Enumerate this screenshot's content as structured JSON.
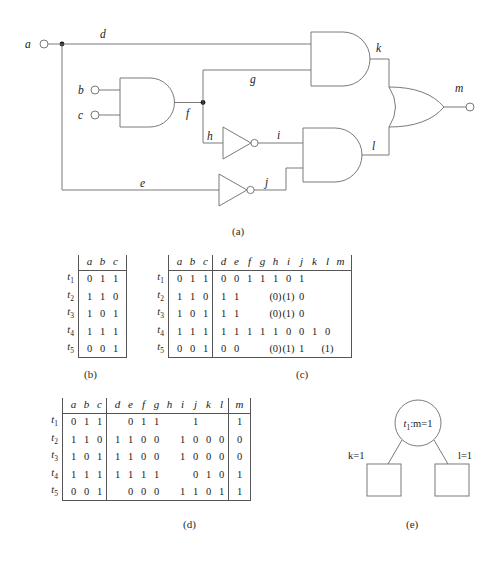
{
  "figure": {
    "captions": {
      "a": "(a)",
      "b": "(b)",
      "c": "(c)",
      "d": "(d)",
      "e": "(e)"
    }
  },
  "circuit": {
    "inputs": [
      {
        "name": "a",
        "label": "a"
      },
      {
        "name": "b",
        "label": "b"
      },
      {
        "name": "c",
        "label": "c"
      }
    ],
    "wires": [
      {
        "name": "d",
        "label": "d"
      },
      {
        "name": "e",
        "label": "e"
      },
      {
        "name": "f",
        "label": "f"
      },
      {
        "name": "g",
        "label": "g"
      },
      {
        "name": "h",
        "label": "h"
      },
      {
        "name": "i",
        "label": "i"
      },
      {
        "name": "j",
        "label": "j"
      },
      {
        "name": "k",
        "label": "k"
      },
      {
        "name": "l",
        "label": "l"
      }
    ],
    "output": {
      "name": "m",
      "label": "m"
    },
    "gates": [
      {
        "name": "and-bc",
        "type": "and",
        "inputs": [
          "b",
          "c"
        ],
        "output": "f"
      },
      {
        "name": "not-h",
        "type": "not",
        "inputs": [
          "h"
        ],
        "output": "i"
      },
      {
        "name": "not-e",
        "type": "not",
        "inputs": [
          "e"
        ],
        "output": "j"
      },
      {
        "name": "and-dg",
        "type": "and",
        "inputs": [
          "d",
          "g"
        ],
        "output": "k"
      },
      {
        "name": "and-ij",
        "type": "and",
        "inputs": [
          "i",
          "j"
        ],
        "output": "l"
      },
      {
        "name": "or-kl",
        "type": "or",
        "inputs": [
          "k",
          "l"
        ],
        "output": "m"
      }
    ]
  },
  "table_b": {
    "row_labels": [
      "t",
      "t",
      "t",
      "t",
      "t"
    ],
    "row_subs": [
      "1",
      "2",
      "3",
      "4",
      "5"
    ],
    "headers": [
      "a",
      "b",
      "c"
    ],
    "rows": [
      [
        "0",
        "1",
        "1"
      ],
      [
        "1",
        "1",
        "0"
      ],
      [
        "1",
        "0",
        "1"
      ],
      [
        "1",
        "1",
        "1"
      ],
      [
        "0",
        "0",
        "1"
      ]
    ]
  },
  "table_c": {
    "row_labels": [
      "t",
      "t",
      "t",
      "t",
      "t"
    ],
    "row_subs": [
      "1",
      "2",
      "3",
      "4",
      "5"
    ],
    "headers_left": [
      "a",
      "b",
      "c"
    ],
    "headers_right": [
      "d",
      "e",
      "f",
      "g",
      "h",
      "i",
      "j",
      "k",
      "l",
      "m"
    ],
    "rows_left": [
      [
        "0",
        "1",
        "1"
      ],
      [
        "1",
        "1",
        "0"
      ],
      [
        "1",
        "0",
        "1"
      ],
      [
        "1",
        "1",
        "1"
      ],
      [
        "0",
        "0",
        "1"
      ]
    ],
    "rows_right": [
      [
        "0",
        "0",
        "1",
        "1",
        "1",
        "0",
        "1",
        "",
        "",
        ""
      ],
      [
        "1",
        "1",
        "",
        "",
        "(0)",
        "(1)",
        "0",
        "",
        "",
        ""
      ],
      [
        "1",
        "1",
        "",
        "",
        "(0)",
        "(1)",
        "0",
        "",
        "",
        ""
      ],
      [
        "1",
        "1",
        "1",
        "1",
        "1",
        "0",
        "0",
        "1",
        "0",
        ""
      ],
      [
        "0",
        "0",
        "",
        "",
        "(0)",
        "(1)",
        "1",
        "",
        "(1)",
        ""
      ]
    ]
  },
  "table_d": {
    "row_labels": [
      "t",
      "t",
      "t",
      "t",
      "t"
    ],
    "row_subs": [
      "1",
      "2",
      "3",
      "4",
      "5"
    ],
    "headers_left": [
      "a",
      "b",
      "c"
    ],
    "headers_mid": [
      "d",
      "e",
      "f",
      "g",
      "h",
      "i",
      "j",
      "k",
      "l"
    ],
    "headers_right": [
      "m"
    ],
    "rows_left": [
      [
        "0",
        "1",
        "1"
      ],
      [
        "1",
        "1",
        "0"
      ],
      [
        "1",
        "0",
        "1"
      ],
      [
        "1",
        "1",
        "1"
      ],
      [
        "0",
        "0",
        "1"
      ]
    ],
    "rows_mid": [
      [
        "",
        "0",
        "1",
        "1",
        "",
        "",
        "1",
        "",
        ""
      ],
      [
        "1",
        "1",
        "0",
        "0",
        "",
        "1",
        "0",
        "0",
        "0"
      ],
      [
        "1",
        "1",
        "0",
        "0",
        "",
        "1",
        "0",
        "0",
        "0"
      ],
      [
        "1",
        "1",
        "1",
        "1",
        "",
        "",
        "0",
        "1",
        "0"
      ],
      [
        "",
        "0",
        "0",
        "0",
        "",
        "1",
        "1",
        "0",
        "1"
      ]
    ],
    "rows_right": [
      [
        "1"
      ],
      [
        "0"
      ],
      [
        "0"
      ],
      [
        "1"
      ],
      [
        "1"
      ]
    ]
  },
  "part_e": {
    "root_label_prefix": "t",
    "root_label_sub": "1",
    "root_label_suffix": ":m=1",
    "edge_left_label": "k=1",
    "edge_right_label": "l=1",
    "leaves": [
      "",
      ""
    ]
  }
}
